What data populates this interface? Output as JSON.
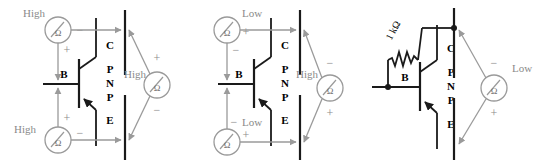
{
  "figure": {
    "background": "#ffffff",
    "wire_color": "#1a1a1a",
    "lead_color": "#9a9a9a",
    "label_color": "#8a8a8a",
    "text_color": "#000000"
  },
  "transistor": {
    "type": "PNP",
    "letters": [
      "P",
      "N",
      "P"
    ],
    "terminals": {
      "base": "B",
      "collector": "C",
      "emitter": "E"
    }
  },
  "meter": {
    "symbol": "Ω",
    "name": "ohmmeter"
  },
  "circuits": [
    {
      "id": "circuit-1",
      "name": "all-junctions-high",
      "meters": [
        {
          "id": "c1-meter-top",
          "position": "top-left",
          "reading": "High",
          "reading_side": "left",
          "terminals": [
            {
              "sign": "−",
              "side": "right"
            },
            {
              "sign": "+",
              "side": "bottom"
            }
          ],
          "probes": [
            "collector",
            "base"
          ]
        },
        {
          "id": "c1-meter-bottom",
          "position": "bottom-left",
          "reading": "High",
          "reading_side": "left",
          "terminals": [
            {
              "sign": "+",
              "side": "top"
            },
            {
              "sign": "−",
              "side": "right"
            }
          ],
          "probes": [
            "base",
            "emitter"
          ]
        },
        {
          "id": "c1-meter-right",
          "position": "right",
          "reading": "High",
          "reading_side": "left",
          "terminals": [
            {
              "sign": "+",
              "side": "top"
            },
            {
              "sign": "−",
              "side": "bottom"
            }
          ],
          "probes": [
            "collector",
            "emitter"
          ]
        }
      ]
    },
    {
      "id": "circuit-2",
      "name": "forward-biased-junctions-low",
      "meters": [
        {
          "id": "c2-meter-top",
          "position": "top-left",
          "reading": "Low",
          "reading_side": "top",
          "terminals": [
            {
              "sign": "+",
              "side": "right"
            },
            {
              "sign": "−",
              "side": "bottom"
            }
          ],
          "probes": [
            "collector",
            "base"
          ]
        },
        {
          "id": "c2-meter-bottom",
          "position": "bottom-left",
          "reading": "Low",
          "reading_side": "top",
          "terminals": [
            {
              "sign": "−",
              "side": "top"
            },
            {
              "sign": "+",
              "side": "right"
            }
          ],
          "probes": [
            "base",
            "emitter"
          ]
        },
        {
          "id": "c2-meter-right",
          "position": "right",
          "reading": "High",
          "reading_side": "left",
          "terminals": [
            {
              "sign": "−",
              "side": "top"
            },
            {
              "sign": "+",
              "side": "bottom"
            }
          ],
          "probes": [
            "collector",
            "emitter"
          ]
        }
      ]
    },
    {
      "id": "circuit-3",
      "name": "resistor-base-collector-low",
      "resistor": {
        "value": "1 kΩ",
        "between": [
          "base",
          "collector"
        ]
      },
      "meters": [
        {
          "id": "c3-meter-right",
          "position": "right",
          "reading": "Low",
          "reading_side": "right",
          "terminals": [
            {
              "sign": "−",
              "side": "top"
            },
            {
              "sign": "+",
              "side": "bottom"
            }
          ],
          "probes": [
            "collector",
            "emitter"
          ]
        }
      ]
    }
  ]
}
